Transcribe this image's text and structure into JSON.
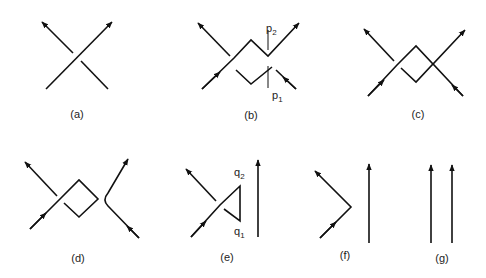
{
  "figure": {
    "colors": {
      "ink": "#111111",
      "background": "#ffffff"
    },
    "panels": [
      {
        "id": "a",
        "label": "(a)",
        "content": "single crossing of two oriented strands"
      },
      {
        "id": "b",
        "label": "(b)",
        "content": "crossing with a square loop; points p1, p2 marked",
        "points": [
          {
            "name": "p",
            "sub": "2"
          },
          {
            "name": "p",
            "sub": "1"
          }
        ]
      },
      {
        "id": "c",
        "label": "(c)",
        "content": "crossing with a square loop"
      },
      {
        "id": "d",
        "label": "(d)",
        "content": "crossing with a square loop and a bent strand"
      },
      {
        "id": "e",
        "label": "(e)",
        "content": "crossing with triangular loop; points q1, q2; vertical strand",
        "points": [
          {
            "name": "q",
            "sub": "2"
          },
          {
            "name": "q",
            "sub": "1"
          }
        ]
      },
      {
        "id": "f",
        "label": "(f)",
        "content": "bent strand and vertical strand"
      },
      {
        "id": "g",
        "label": "(g)",
        "content": "two parallel vertical strands"
      }
    ]
  }
}
